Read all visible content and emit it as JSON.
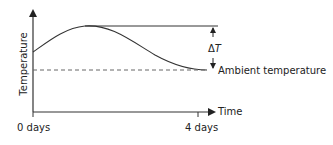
{
  "diagram": {
    "y_axis_label": "Temperature",
    "x_axis_label": "Time",
    "x_tick_start": "0 days",
    "x_tick_end": "4 days",
    "delta_label": "ΔT",
    "delta_symbol": "Δ",
    "delta_var": "T",
    "ambient_label": "Ambient temperature",
    "colors": {
      "line": "#333333",
      "dashed": "#666666",
      "text": "#222222"
    }
  }
}
